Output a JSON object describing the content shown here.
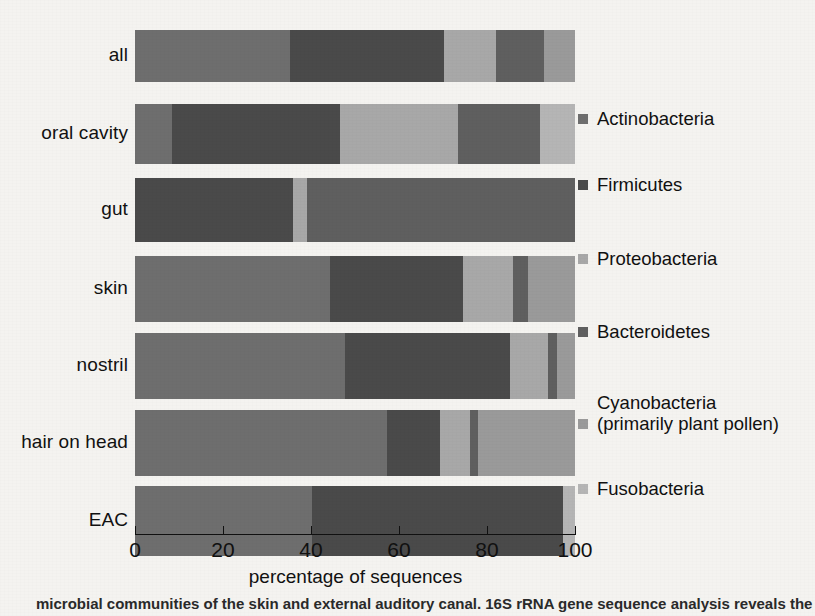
{
  "chart_data": {
    "type": "bar",
    "orientation": "horizontal",
    "stacked": true,
    "title": "",
    "xlabel": "percentage of sequences",
    "ylabel": "",
    "xlim": [
      0,
      100
    ],
    "xticks": [
      0,
      20,
      40,
      60,
      80,
      100
    ],
    "xtick_labels": [
      "0",
      "20",
      "40",
      "60",
      "80",
      "100"
    ],
    "grid": false,
    "legend_position": "right",
    "categories": [
      "all",
      "oral cavity",
      "gut",
      "skin",
      "nostril",
      "hair on head",
      "EAC"
    ],
    "series": [
      {
        "name": "Actinobacteria",
        "color": "#6e6e6e",
        "values": [
          35.2,
          8.3,
          0.0,
          44.3,
          47.7,
          57.3,
          40.2
        ]
      },
      {
        "name": "Firmicutes",
        "color": "#4a4a4a",
        "values": [
          35.0,
          38.3,
          36.0,
          30.2,
          37.5,
          12.0,
          57.1
        ]
      },
      {
        "name": "Proteobacteria",
        "color": "#a8a8a8",
        "values": [
          11.8,
          26.8,
          3.0,
          11.5,
          8.7,
          6.8,
          0.0
        ]
      },
      {
        "name": "Bacteroidetes",
        "color": "#5f5f5f",
        "values": [
          10.9,
          18.6,
          61.0,
          3.3,
          2.0,
          1.9,
          0.0
        ]
      },
      {
        "name": "Cyanobacteria (primarily plant pollen)",
        "color": "#9a9a9a",
        "values": [
          7.1,
          0.0,
          0.0,
          10.7,
          4.1,
          22.0,
          0.0
        ]
      },
      {
        "name": "Fusobacteria",
        "color": "#b5b5b5",
        "values": [
          0.0,
          8.0,
          0.0,
          0.0,
          0.0,
          0.0,
          2.7
        ]
      }
    ]
  },
  "axis": {
    "x_title": "percentage of sequences",
    "tick_labels": [
      "0",
      "20",
      "40",
      "60",
      "80",
      "100"
    ]
  },
  "legend": {
    "items": [
      {
        "label": "Actinobacteria",
        "swatch": "#6e6e6e"
      },
      {
        "label": "Firmicutes",
        "swatch": "#4a4a4a"
      },
      {
        "label": "Proteobacteria",
        "swatch": "#a8a8a8"
      },
      {
        "label": "Bacteroidetes",
        "swatch": "#5f5f5f"
      },
      {
        "label": "Cyanobacteria\n(primarily plant pollen)",
        "swatch": "#9a9a9a"
      },
      {
        "label": "Fusobacteria",
        "swatch": "#b5b5b5"
      }
    ]
  },
  "caption": {
    "partial_text": "microbial communities of the skin and external auditory canal. 16S rRNA gene sequence analysis reveals the"
  },
  "colors": {
    "background": "#f4f3f0",
    "text": "#111111",
    "axis": "#111111"
  }
}
